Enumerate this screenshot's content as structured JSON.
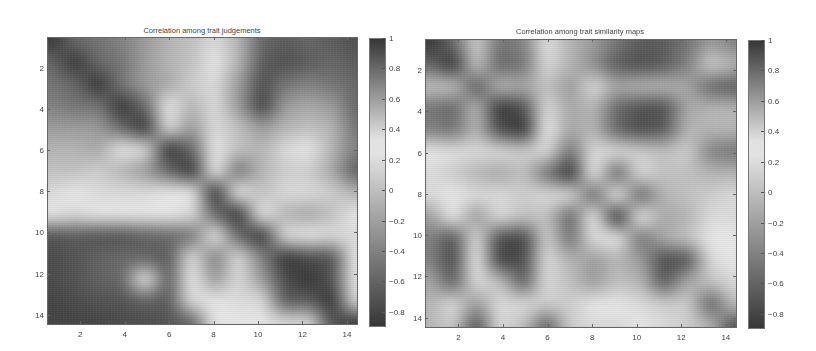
{
  "chart_data": [
    {
      "type": "heatmap",
      "title": "Correlation among trait judgements",
      "xlabel": "",
      "ylabel": "",
      "x_ticks": [
        2,
        4,
        6,
        8,
        10,
        12,
        14
      ],
      "y_ticks": [
        2,
        4,
        6,
        8,
        10,
        12,
        14
      ],
      "xlim": [
        0.5,
        14.5
      ],
      "ylim": [
        0.5,
        14.5
      ],
      "colorbar": {
        "ticks": [
          1,
          0.8,
          0.6,
          0.4,
          0.2,
          0,
          -0.2,
          -0.4,
          -0.6,
          -0.8
        ],
        "range": [
          -0.9,
          1.0
        ],
        "colormap": "grayscale, dark at both extremes, brightest near 0.3"
      },
      "matrix_size": 14,
      "values": [
        [
          1.0,
          0.8,
          0.75,
          0.7,
          0.6,
          0.5,
          0.45,
          0.35,
          0.5,
          0.8,
          0.85,
          0.8,
          0.85,
          0.9
        ],
        [
          0.8,
          1.0,
          0.8,
          0.75,
          0.6,
          0.5,
          0.45,
          0.3,
          0.5,
          0.85,
          0.9,
          0.85,
          0.8,
          0.85
        ],
        [
          0.75,
          0.8,
          1.0,
          0.75,
          0.6,
          0.55,
          0.4,
          0.35,
          0.6,
          0.9,
          0.75,
          0.7,
          0.75,
          0.8
        ],
        [
          0.7,
          0.75,
          0.75,
          1.0,
          0.8,
          0.3,
          0.5,
          0.35,
          0.6,
          0.95,
          0.6,
          0.55,
          0.6,
          0.8
        ],
        [
          0.6,
          0.6,
          0.6,
          0.8,
          1.0,
          0.35,
          0.6,
          0.35,
          0.45,
          0.6,
          0.5,
          0.45,
          0.5,
          0.75
        ],
        [
          0.5,
          0.5,
          0.55,
          0.3,
          0.35,
          1.0,
          0.8,
          0.3,
          0.45,
          0.5,
          0.35,
          0.3,
          0.5,
          0.7
        ],
        [
          0.45,
          0.45,
          0.4,
          0.5,
          0.6,
          0.8,
          1.0,
          0.3,
          0.75,
          0.5,
          0.4,
          0.4,
          0.55,
          0.85
        ],
        [
          0.35,
          0.3,
          0.35,
          0.35,
          0.35,
          0.3,
          0.3,
          1.0,
          0.3,
          0.45,
          0.35,
          0.35,
          0.4,
          0.5
        ],
        [
          0.3,
          0.35,
          0.3,
          0.3,
          0.3,
          0.3,
          0.35,
          0.8,
          1.0,
          0.3,
          0.5,
          0.55,
          0.45,
          0.3
        ],
        [
          -0.7,
          -0.65,
          -0.7,
          -0.7,
          -0.6,
          -0.55,
          0.75,
          0.3,
          0.8,
          1.0,
          0.35,
          0.3,
          0.35,
          0.35
        ],
        [
          -0.75,
          -0.7,
          -0.6,
          -0.55,
          -0.6,
          -0.65,
          0.35,
          0.7,
          0.35,
          0.7,
          1.0,
          -0.75,
          -0.7,
          0.3
        ],
        [
          -0.75,
          -0.7,
          -0.6,
          -0.55,
          0.3,
          -0.6,
          0.3,
          0.6,
          0.35,
          0.6,
          -0.75,
          1.0,
          -0.7,
          0.3
        ],
        [
          -0.8,
          -0.75,
          -0.7,
          -0.7,
          -0.6,
          -0.65,
          0.35,
          0.3,
          0.35,
          0.35,
          -0.65,
          -0.65,
          1.0,
          0.35
        ],
        [
          -0.8,
          -0.8,
          -0.8,
          -0.75,
          -0.75,
          -0.7,
          -0.6,
          0.3,
          0.3,
          0.3,
          0.35,
          0.35,
          -0.7,
          1.0
        ]
      ]
    },
    {
      "type": "heatmap",
      "title": "Correlation among trait similarity maps",
      "xlabel": "",
      "ylabel": "",
      "x_ticks": [
        2,
        4,
        6,
        8,
        10,
        12,
        14
      ],
      "y_ticks": [
        2,
        4,
        6,
        8,
        10,
        12,
        14
      ],
      "xlim": [
        0.5,
        14.5
      ],
      "ylim": [
        0.5,
        14.5
      ],
      "colorbar": {
        "ticks": [
          1,
          0.8,
          0.6,
          0.4,
          0.2,
          0,
          -0.2,
          -0.4,
          -0.6,
          -0.8
        ],
        "range": [
          -0.9,
          1.0
        ],
        "colormap": "grayscale, dark at both extremes, brightest near 0.3"
      },
      "matrix_size": 14,
      "values": [
        [
          1.0,
          0.8,
          0.4,
          0.75,
          0.7,
          0.25,
          0.5,
          0.6,
          0.75,
          0.85,
          0.85,
          0.75,
          0.6,
          0.7
        ],
        [
          0.8,
          1.0,
          0.45,
          0.8,
          0.75,
          0.2,
          0.5,
          0.65,
          0.85,
          0.9,
          0.85,
          0.7,
          0.4,
          0.5
        ],
        [
          0.45,
          0.45,
          0.85,
          0.5,
          0.55,
          0.45,
          0.6,
          0.35,
          0.55,
          0.5,
          0.5,
          0.55,
          0.8,
          0.85
        ],
        [
          0.75,
          0.8,
          0.5,
          1.0,
          0.9,
          0.2,
          0.55,
          0.5,
          0.8,
          0.9,
          0.9,
          0.55,
          0.5,
          0.5
        ],
        [
          0.7,
          0.75,
          0.5,
          0.9,
          1.0,
          0.3,
          0.55,
          0.5,
          0.8,
          0.9,
          0.85,
          0.5,
          0.5,
          0.5
        ],
        [
          0.3,
          0.25,
          0.35,
          0.35,
          0.4,
          0.2,
          0.75,
          0.35,
          0.35,
          0.4,
          0.45,
          0.4,
          0.7,
          0.75
        ],
        [
          0.35,
          0.4,
          0.5,
          0.55,
          0.45,
          0.75,
          1.0,
          0.3,
          0.8,
          0.35,
          0.45,
          0.45,
          0.5,
          0.5
        ],
        [
          0.35,
          0.3,
          0.35,
          0.35,
          0.4,
          0.35,
          0.35,
          0.8,
          0.3,
          0.8,
          0.5,
          0.45,
          0.4,
          0.35
        ],
        [
          0.6,
          0.3,
          0.6,
          0.35,
          0.45,
          0.45,
          0.8,
          0.3,
          1.0,
          0.3,
          0.55,
          0.5,
          0.35,
          0.35
        ],
        [
          0.7,
          -0.7,
          0.35,
          -0.75,
          -0.8,
          0.4,
          0.75,
          0.35,
          0.3,
          0.75,
          0.55,
          0.45,
          0.3,
          0.3
        ],
        [
          0.7,
          -0.75,
          0.3,
          -0.8,
          -0.75,
          0.35,
          0.5,
          0.6,
          0.5,
          0.6,
          -0.75,
          -0.7,
          0.35,
          0.3
        ],
        [
          0.55,
          -0.6,
          0.35,
          0.45,
          -0.6,
          0.35,
          0.45,
          0.6,
          0.45,
          0.5,
          -0.65,
          0.55,
          0.45,
          0.35
        ],
        [
          0.5,
          0.35,
          0.6,
          0.35,
          0.35,
          0.4,
          0.4,
          0.3,
          0.3,
          0.35,
          0.4,
          0.4,
          -0.6,
          0.45
        ],
        [
          0.5,
          0.4,
          -0.7,
          0.35,
          0.45,
          -0.6,
          0.4,
          0.35,
          0.35,
          0.3,
          0.35,
          0.4,
          0.5,
          -0.75
        ]
      ]
    }
  ],
  "figure": {
    "panels": [
      {
        "title": "Correlation among trait judgements",
        "y_tick_labels": [
          "2",
          "4",
          "6",
          "8",
          "10",
          "12",
          "14"
        ],
        "x_tick_labels": [
          "2",
          "4",
          "6",
          "8",
          "10",
          "12",
          "14"
        ],
        "colorbar_labels": [
          "1",
          "0.8",
          "0.6",
          "0.4",
          "0.2",
          "0",
          "−0.2",
          "−0.4",
          "−0.6",
          "−0.8"
        ]
      },
      {
        "title": "Correlation among trait similarity maps",
        "y_tick_labels": [
          "2",
          "4",
          "6",
          "8",
          "10",
          "12",
          "14"
        ],
        "x_tick_labels": [
          "2",
          "4",
          "6",
          "8",
          "10",
          "12",
          "14"
        ],
        "colorbar_labels": [
          "1",
          "0.8",
          "0.6",
          "0.4",
          "0.2",
          "0",
          "−0.2",
          "−0.4",
          "−0.6",
          "−0.8"
        ]
      }
    ]
  }
}
